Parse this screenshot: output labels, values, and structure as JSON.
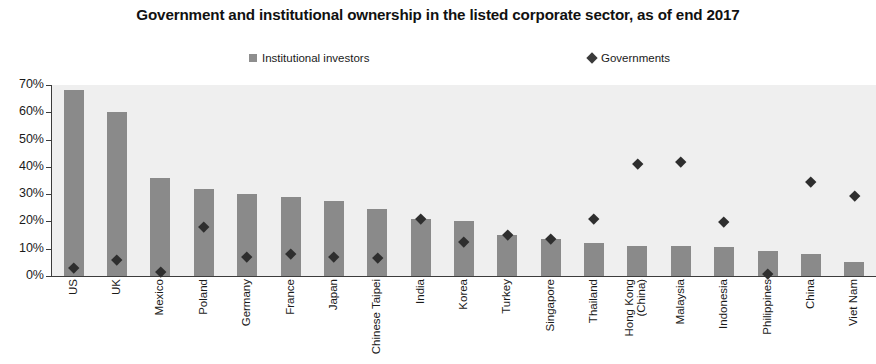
{
  "chart_data": {
    "type": "bar",
    "title": "Government and institutional ownership in the listed corporate sector, as of end 2017",
    "xlabel": "",
    "ylabel": "",
    "ylim": [
      0,
      70
    ],
    "ytick_labels": [
      "70%",
      "60%",
      "50%",
      "40%",
      "30%",
      "20%",
      "10%",
      "0%"
    ],
    "ytick_values": [
      70,
      60,
      50,
      40,
      30,
      20,
      10,
      0
    ],
    "grid": false,
    "legend_position": "top",
    "categories": [
      "US",
      "UK",
      "Mexico",
      "Poland",
      "Germany",
      "France",
      "Japan",
      "Chinese Taipei",
      "India",
      "Korea",
      "Turkey",
      "Singapore",
      "Thailand",
      "Hong Kong (China)",
      "Malaysia",
      "Indonesia",
      "Philippines",
      "China",
      "Viet Nam"
    ],
    "series": [
      {
        "name": "Institutional investors",
        "type": "bar",
        "color": "#8a8a8a",
        "values": [
          68,
          60,
          36,
          32,
          30,
          29,
          27.5,
          24.5,
          21,
          20,
          15,
          13.5,
          12,
          11,
          11,
          10.5,
          9,
          8,
          5
        ]
      },
      {
        "name": "Governments",
        "type": "scatter",
        "color": "#2e2e2e",
        "values": [
          3,
          6,
          1.5,
          18,
          7,
          8,
          7,
          6.8,
          21,
          12.5,
          15,
          13.5,
          21,
          41,
          42,
          20,
          1,
          34.5,
          29.5
        ]
      }
    ]
  },
  "legend": {
    "entries": [
      {
        "label": "Institutional investors",
        "marker": "square"
      },
      {
        "label": "Governments",
        "marker": "diamond"
      }
    ]
  },
  "colors": {
    "bar": "#8a8a8a",
    "diamond": "#2e2e2e",
    "plot_background": "#efefef",
    "axis": "#3c3c3c",
    "text": "#1a1a1a"
  }
}
